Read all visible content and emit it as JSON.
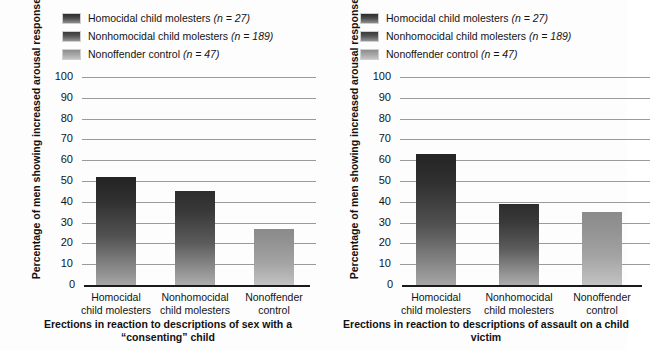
{
  "figure": {
    "background_color": "#fdfdfd",
    "axis_color": "#1a1a1a",
    "grid_color": "#9a9a9a"
  },
  "legend": {
    "position": "top-left",
    "entries": [
      {
        "label": "Homocidal child molesters",
        "stat": "(n = 27)",
        "color": "#3a3a3a",
        "swatch": "sw-0"
      },
      {
        "label": "Nonhomocidal child molesters",
        "stat": "(n = 189)",
        "color": "#474747",
        "swatch": "sw-1"
      },
      {
        "label": "Nonoffender control",
        "stat": "(n = 47)",
        "color": "#a4a4a4",
        "swatch": "sw-2"
      }
    ]
  },
  "axis": {
    "ylabel": "Percentage of men showing increased arousal response",
    "yticks": [
      "100",
      "90",
      "80",
      "70",
      "60",
      "50",
      "40",
      "30",
      "20",
      "10",
      "0"
    ]
  },
  "chart_data": [
    {
      "type": "bar",
      "title": "Erections in reaction to descriptions of sex with a “consenting” child",
      "xlabel": "",
      "ylabel": "Percentage of men showing increased arousal response",
      "ylim": [
        0,
        100
      ],
      "yticks": [
        0,
        10,
        20,
        30,
        40,
        50,
        60,
        70,
        80,
        90,
        100
      ],
      "grid": true,
      "legend_position": "top-left",
      "categories": [
        "Homocidal child molesters",
        "Nonhomocidal child molesters",
        "Nonoffender control"
      ],
      "category_lines": [
        [
          "Homocidal",
          "child molesters"
        ],
        [
          "Nonhomocidal",
          "child molesters"
        ],
        [
          "Nonoffender",
          "control"
        ]
      ],
      "values": [
        52,
        45,
        27
      ],
      "n": [
        27,
        189,
        47
      ]
    },
    {
      "type": "bar",
      "title": "Erections in reaction to descriptions of assault on a child victim",
      "xlabel": "",
      "ylabel": "Percentage of men showing increased arousal response",
      "ylim": [
        0,
        100
      ],
      "yticks": [
        0,
        10,
        20,
        30,
        40,
        50,
        60,
        70,
        80,
        90,
        100
      ],
      "grid": true,
      "legend_position": "top-left",
      "categories": [
        "Homocidal child molesters",
        "Nonhomocidal child molesters",
        "Nonoffender control"
      ],
      "category_lines": [
        [
          "Homocidal",
          "child molesters"
        ],
        [
          "Nonhomocidal",
          "child molesters"
        ],
        [
          "Nonoffender",
          "control"
        ]
      ],
      "values": [
        63,
        39,
        35
      ],
      "n": [
        27,
        189,
        47
      ],
      "note": "third bar and its label are cropped at the right edge of the image"
    }
  ]
}
